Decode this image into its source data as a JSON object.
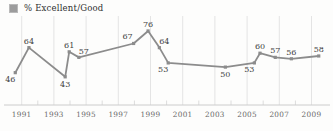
{
  "legend": {
    "label": "% Excellent/Good",
    "swatch_color": "#9c9c9c"
  },
  "colors": {
    "background": "#fdfdfc",
    "line": "#8c8c8c",
    "marker": "#8c8c8c",
    "grid": "#e4e4e4",
    "minor_tick": "#dcdcdc",
    "axis": "#cccccc",
    "point_label": "#3f3f3f",
    "year_label": "#6a6a6a"
  },
  "chart_data": {
    "type": "line",
    "title": "% Excellent/Good",
    "xlabel": "",
    "ylabel": "",
    "xlim": [
      1990,
      2010
    ],
    "grid": "vertical gridlines at labeled years, minor ticks at unlabeled years",
    "legend_position": "top-left",
    "x_tick_labels": [
      "1991",
      "1993",
      "1995",
      "1997",
      "1999",
      "2001",
      "2003",
      "2005",
      "2007",
      "2009"
    ],
    "x_tick_years": [
      1991,
      1993,
      1995,
      1997,
      1999,
      2001,
      2003,
      2005,
      2007,
      2009
    ],
    "minor_tick_years": [
      1992,
      1994,
      1996,
      1998,
      2000,
      2002,
      2004,
      2006,
      2008
    ],
    "series": [
      {
        "name": "% Excellent/Good",
        "points": [
          {
            "x": 1990.6,
            "y": 46,
            "label": "46",
            "label_pos": "below-left"
          },
          {
            "x": 1991.45,
            "y": 64,
            "label": "64",
            "label_pos": "above"
          },
          {
            "x": 1993.7,
            "y": 43,
            "label": "43",
            "label_pos": "below"
          },
          {
            "x": 1993.95,
            "y": 61,
            "label": "61",
            "label_pos": "above"
          },
          {
            "x": 1994.55,
            "y": 57,
            "label": "57",
            "label_pos": "above-right"
          },
          {
            "x": 1997.95,
            "y": 67,
            "label": "67",
            "label_pos": "above-left"
          },
          {
            "x": 1998.85,
            "y": 76,
            "label": "76",
            "label_pos": "above"
          },
          {
            "x": 1999.55,
            "y": 64,
            "label": "64",
            "label_pos": "above-right"
          },
          {
            "x": 2000.1,
            "y": 53,
            "label": "53",
            "label_pos": "below-left"
          },
          {
            "x": 2003.65,
            "y": 50,
            "label": "50",
            "label_pos": "below"
          },
          {
            "x": 2005.45,
            "y": 53,
            "label": "53",
            "label_pos": "below-left"
          },
          {
            "x": 2005.8,
            "y": 60,
            "label": "60",
            "label_pos": "above"
          },
          {
            "x": 2006.75,
            "y": 57,
            "label": "57",
            "label_pos": "above"
          },
          {
            "x": 2007.75,
            "y": 56,
            "label": "56",
            "label_pos": "above"
          },
          {
            "x": 2009.45,
            "y": 58,
            "label": "58",
            "label_pos": "above"
          }
        ]
      }
    ]
  }
}
